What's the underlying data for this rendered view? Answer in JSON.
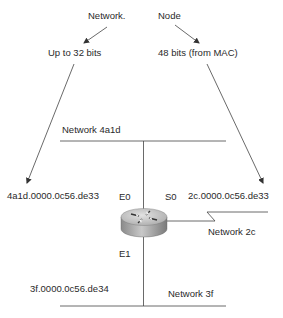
{
  "diagram": {
    "type": "network-address-diagram",
    "header": {
      "network_label": "Network.",
      "node_label": "Node"
    },
    "field_sizes": {
      "network": "Up to 32 bits",
      "node": "48 bits (from MAC)"
    },
    "networks": {
      "top": "Network 4a1d",
      "serial": "Network 2c",
      "bottom": "Network 3f"
    },
    "interfaces": {
      "e0": "E0",
      "s0": "S0",
      "e1": "E1"
    },
    "addresses": {
      "e0_address": "4a1d.0000.0c56.de33",
      "s0_address": "2c.0000.0c56.de33",
      "e1_address": "3f.0000.0c56.de34"
    },
    "colors": {
      "line": "#444444",
      "router_top": "#cfcfcf",
      "router_side": "#9a9a9a"
    }
  }
}
